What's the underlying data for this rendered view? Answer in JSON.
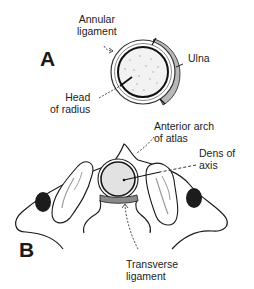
{
  "figure": {
    "panels": [
      {
        "letter": "A",
        "structure": "proximal radioulnar joint",
        "labels": {
          "annular_ligament": "Annular\nligament",
          "ulna": "Ulna",
          "head_of_radius": "Head\nof radius"
        }
      },
      {
        "letter": "B",
        "structure": "atlantoaxial joint",
        "labels": {
          "anterior_arch": "Anterior arch\nof atlas",
          "dens": "Dens of\naxis",
          "transverse_ligament": "Transverse\nligament"
        }
      }
    ],
    "colors": {
      "outline": "#1a1a1a",
      "ulna_fill": "#b8b8b8",
      "radius_fill": "#f2f2f2",
      "dens_fill": "#e2e2e2",
      "ligament_fill": "#8a8a8a",
      "foramen_fill": "#1c1c1c",
      "facet_stroke": "#9a9a9a"
    }
  }
}
